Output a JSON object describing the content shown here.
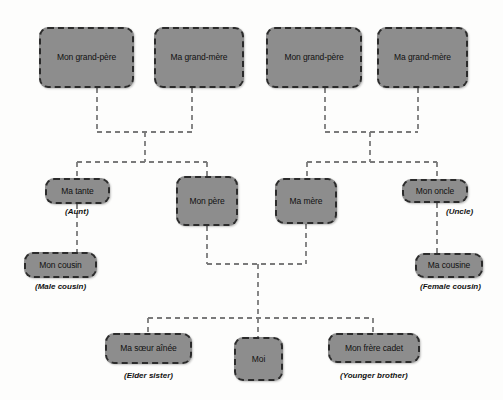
{
  "diagram": {
    "colors": {
      "node_fill": "#8d8d8d",
      "node_border": "#2b2b2b",
      "connector": "#7a7a7a",
      "background": "#fdfdfc",
      "text": "#111111"
    },
    "nodes": [
      {
        "id": "paternal-grandfather",
        "label": "Mon grand-père",
        "caption": "",
        "x": 39,
        "y": 27,
        "w": 95,
        "h": 61
      },
      {
        "id": "paternal-grandmother",
        "label": "Ma grand-mère",
        "caption": "",
        "x": 154,
        "y": 27,
        "w": 90,
        "h": 61
      },
      {
        "id": "maternal-grandfather",
        "label": "Mon grand-père",
        "caption": "",
        "x": 266,
        "y": 27,
        "w": 96,
        "h": 61
      },
      {
        "id": "maternal-grandmother",
        "label": "Ma grand-mère",
        "caption": "",
        "x": 377,
        "y": 27,
        "w": 91,
        "h": 61
      },
      {
        "id": "aunt",
        "label": "Ma tante",
        "caption": "(Aunt)",
        "x": 45,
        "y": 178,
        "w": 65,
        "h": 26
      },
      {
        "id": "father",
        "label": "Mon père",
        "caption": "",
        "x": 176,
        "y": 176,
        "w": 62,
        "h": 50
      },
      {
        "id": "mother",
        "label": "Ma mère",
        "caption": "",
        "x": 275,
        "y": 178,
        "w": 62,
        "h": 46
      },
      {
        "id": "uncle",
        "label": "Mon oncle",
        "caption": "(Uncle)",
        "x": 402,
        "y": 179,
        "w": 66,
        "h": 24
      },
      {
        "id": "male-cousin",
        "label": "Mon cousin",
        "caption": "(Male cousin)",
        "x": 24,
        "y": 252,
        "w": 73,
        "h": 26
      },
      {
        "id": "female-cousin",
        "label": "Ma cousine",
        "caption": "(Female cousin)",
        "x": 415,
        "y": 253,
        "w": 68,
        "h": 25
      },
      {
        "id": "elder-sister",
        "label": "Ma sœur aînée",
        "caption": "(Elder sister)",
        "x": 105,
        "y": 333,
        "w": 87,
        "h": 31
      },
      {
        "id": "self",
        "label": "Moi",
        "caption": "",
        "x": 234,
        "y": 337,
        "w": 49,
        "h": 44
      },
      {
        "id": "younger-brother",
        "label": "Mon frère cadet",
        "caption": "(Younger brother)",
        "x": 328,
        "y": 333,
        "w": 92,
        "h": 30
      }
    ],
    "captions": [
      {
        "id": "aunt-caption",
        "text": "(Aunt)",
        "cx": 77,
        "y": 207
      },
      {
        "id": "uncle-caption",
        "text": "(Uncle)",
        "cx": 459,
        "y": 207
      },
      {
        "id": "male-cousin-caption",
        "text": "(Male cousin)",
        "cx": 60,
        "y": 282
      },
      {
        "id": "female-cousin-caption",
        "text": "(Female cousin)",
        "cx": 450,
        "y": 282
      },
      {
        "id": "elder-sister-caption",
        "text": "(Elder sister)",
        "cx": 148,
        "y": 371
      },
      {
        "id": "younger-brother-caption",
        "text": "(Younger brother)",
        "cx": 374,
        "y": 371
      }
    ],
    "connectors": [
      {
        "id": "pgf-down",
        "points": "97,88 97,132"
      },
      {
        "id": "pgm-down",
        "points": "192,88 192,132"
      },
      {
        "id": "paternal-union-bar",
        "points": "97,132 192,132"
      },
      {
        "id": "paternal-union-drop",
        "points": "145,132 145,162"
      },
      {
        "id": "paternal-children-bar",
        "points": "77,162 207,162"
      },
      {
        "id": "aunt-up",
        "points": "77,162 77,178"
      },
      {
        "id": "father-up",
        "points": "207,162 207,176"
      },
      {
        "id": "mgf-down",
        "points": "325,88 325,132"
      },
      {
        "id": "mgm-down",
        "points": "418,88 418,132"
      },
      {
        "id": "maternal-union-bar",
        "points": "325,132 418,132"
      },
      {
        "id": "maternal-union-drop",
        "points": "370,132 370,162"
      },
      {
        "id": "maternal-children-bar",
        "points": "307,162 437,162"
      },
      {
        "id": "mother-up",
        "points": "307,162 307,178"
      },
      {
        "id": "uncle-up",
        "points": "437,162 437,179"
      },
      {
        "id": "aunt-to-cousin",
        "points": "77,204 77,252"
      },
      {
        "id": "uncle-to-cousin",
        "points": "437,203 437,253"
      },
      {
        "id": "father-down",
        "points": "207,226 207,264"
      },
      {
        "id": "mother-down",
        "points": "306,224 306,264"
      },
      {
        "id": "parents-union-bar",
        "points": "207,264 306,264"
      },
      {
        "id": "parents-union-drop",
        "points": "258,264 258,318"
      },
      {
        "id": "siblings-bar",
        "points": "148,318 373,318"
      },
      {
        "id": "elder-sister-up",
        "points": "148,318 148,333"
      },
      {
        "id": "self-up",
        "points": "258,318 258,337"
      },
      {
        "id": "younger-brother-up",
        "points": "373,318 373,333"
      }
    ]
  }
}
